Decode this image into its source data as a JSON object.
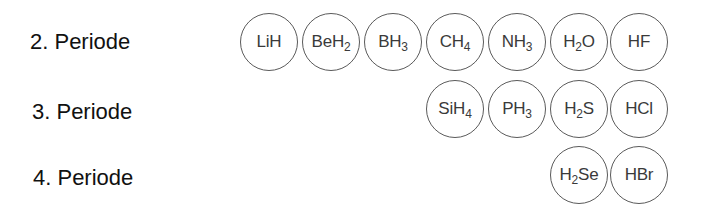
{
  "rows": [
    {
      "label": "2. Periode",
      "molecules": [
        {
          "parts": [
            {
              "t": "LiH"
            }
          ]
        },
        {
          "parts": [
            {
              "t": "BeH"
            },
            {
              "s": "2"
            }
          ]
        },
        {
          "parts": [
            {
              "t": "BH"
            },
            {
              "s": "3"
            }
          ]
        },
        {
          "parts": [
            {
              "t": "CH"
            },
            {
              "s": "4"
            }
          ]
        },
        {
          "parts": [
            {
              "t": "NH"
            },
            {
              "s": "3"
            }
          ]
        },
        {
          "parts": [
            {
              "t": "H"
            },
            {
              "s": "2"
            },
            {
              "t": "O"
            }
          ]
        },
        {
          "parts": [
            {
              "t": "HF"
            }
          ]
        }
      ]
    },
    {
      "label": "3. Periode",
      "molecules": [
        {
          "parts": [
            {
              "t": "SiH"
            },
            {
              "s": "4"
            }
          ]
        },
        {
          "parts": [
            {
              "t": "PH"
            },
            {
              "s": "3"
            }
          ]
        },
        {
          "parts": [
            {
              "t": "H"
            },
            {
              "s": "2"
            },
            {
              "t": "S"
            }
          ]
        },
        {
          "parts": [
            {
              "t": "HCl"
            }
          ]
        }
      ]
    },
    {
      "label": "4. Periode",
      "molecules": [
        {
          "parts": [
            {
              "t": "H"
            },
            {
              "s": "2"
            },
            {
              "t": "Se"
            }
          ]
        },
        {
          "parts": [
            {
              "t": "HBr"
            }
          ]
        }
      ]
    }
  ]
}
